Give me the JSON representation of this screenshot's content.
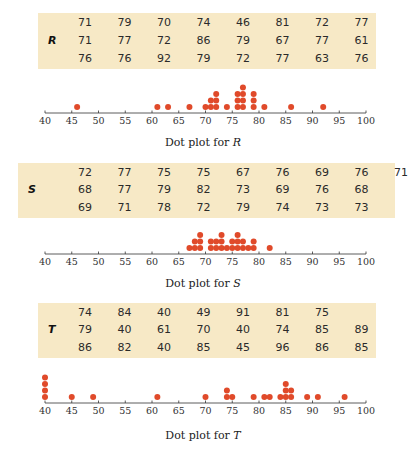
{
  "colors": {
    "table_bg": "#f7e9c6",
    "dot": "#e04a2a",
    "axis": "#333333"
  },
  "axis": {
    "min": 40,
    "max": 100,
    "step": 5,
    "ticks": [
      "40",
      "45",
      "50",
      "55",
      "60",
      "65",
      "70",
      "75",
      "80",
      "85",
      "90",
      "95",
      "100"
    ]
  },
  "datasets": [
    {
      "label": "R",
      "caption_prefix": "Dot plot for ",
      "caption_var": "R",
      "rows": [
        [
          "71",
          "79",
          "70",
          "74",
          "46",
          "81",
          "72",
          "77"
        ],
        [
          "71",
          "77",
          "72",
          "86",
          "79",
          "67",
          "77",
          "61"
        ],
        [
          "76",
          "76",
          "92",
          "79",
          "72",
          "77",
          "63",
          "76"
        ]
      ]
    },
    {
      "label": "S",
      "caption_prefix": "Dot plot for ",
      "caption_var": "S",
      "rows": [
        [
          "72",
          "77",
          "75",
          "75",
          "67",
          "76",
          "69",
          "76",
          "71"
        ],
        [
          "68",
          "77",
          "79",
          "82",
          "73",
          "69",
          "76",
          "68"
        ],
        [
          "69",
          "71",
          "78",
          "72",
          "79",
          "74",
          "73",
          "73"
        ]
      ]
    },
    {
      "label": "T",
      "caption_prefix": "Dot plot for ",
      "caption_var": "T",
      "rows": [
        [
          "74",
          "84",
          "40",
          "49",
          "91",
          "81",
          "75"
        ],
        [
          "79",
          "40",
          "61",
          "70",
          "40",
          "74",
          "85",
          "89"
        ],
        [
          "86",
          "82",
          "40",
          "85",
          "45",
          "96",
          "86",
          "85"
        ]
      ]
    }
  ],
  "chart_data": [
    {
      "type": "scatter",
      "subtype": "dot_plot",
      "title": "Dot plot for R",
      "xlabel": "",
      "ylabel": "",
      "xlim": [
        40,
        100
      ],
      "x_ticks": [
        40,
        45,
        50,
        55,
        60,
        65,
        70,
        75,
        80,
        85,
        90,
        95,
        100
      ],
      "values": [
        71,
        79,
        70,
        74,
        46,
        81,
        72,
        77,
        71,
        77,
        72,
        86,
        79,
        67,
        77,
        61,
        76,
        76,
        92,
        79,
        72,
        77,
        63,
        76
      ],
      "counts": {
        "46": 1,
        "61": 1,
        "63": 1,
        "67": 1,
        "70": 1,
        "71": 2,
        "72": 3,
        "74": 1,
        "76": 3,
        "77": 4,
        "79": 3,
        "81": 1,
        "86": 1,
        "92": 1
      },
      "grid": false
    },
    {
      "type": "scatter",
      "subtype": "dot_plot",
      "title": "Dot plot for S",
      "xlabel": "",
      "ylabel": "",
      "xlim": [
        40,
        100
      ],
      "x_ticks": [
        40,
        45,
        50,
        55,
        60,
        65,
        70,
        75,
        80,
        85,
        90,
        95,
        100
      ],
      "values": [
        72,
        77,
        75,
        75,
        67,
        76,
        69,
        76,
        71,
        68,
        77,
        79,
        82,
        73,
        69,
        76,
        68,
        69,
        71,
        78,
        72,
        79,
        74,
        73,
        73
      ],
      "counts": {
        "67": 1,
        "68": 2,
        "69": 3,
        "71": 2,
        "72": 2,
        "73": 3,
        "74": 1,
        "75": 2,
        "76": 3,
        "77": 2,
        "78": 1,
        "79": 2,
        "82": 1
      },
      "grid": false
    },
    {
      "type": "scatter",
      "subtype": "dot_plot",
      "title": "Dot plot for T",
      "xlabel": "",
      "ylabel": "",
      "xlim": [
        40,
        100
      ],
      "x_ticks": [
        40,
        45,
        50,
        55,
        60,
        65,
        70,
        75,
        80,
        85,
        90,
        95,
        100
      ],
      "values": [
        74,
        84,
        40,
        49,
        91,
        81,
        75,
        79,
        40,
        61,
        70,
        40,
        74,
        85,
        89,
        86,
        82,
        40,
        85,
        45,
        96,
        86,
        85
      ],
      "counts": {
        "40": 4,
        "45": 1,
        "49": 1,
        "61": 1,
        "70": 1,
        "74": 2,
        "75": 1,
        "79": 1,
        "81": 1,
        "82": 1,
        "84": 1,
        "85": 3,
        "86": 2,
        "89": 1,
        "91": 1,
        "96": 1
      },
      "grid": false
    }
  ]
}
